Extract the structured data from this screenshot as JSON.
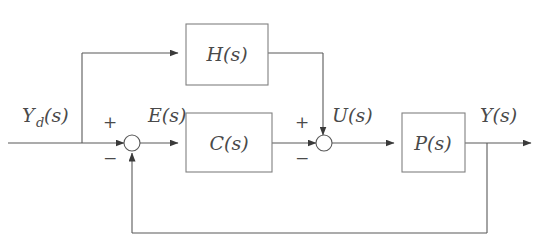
{
  "diagram": {
    "stroke_color": "#595959",
    "text_color": "#4a4a4a",
    "background": "#ffffff",
    "blocks": [
      {
        "id": "H",
        "label": "H(s)",
        "x": 186,
        "y": 24,
        "w": 82,
        "h": 61
      },
      {
        "id": "C",
        "label": "C(s)",
        "x": 186,
        "y": 113,
        "w": 86,
        "h": 59
      },
      {
        "id": "P",
        "label": "P(s)",
        "x": 402,
        "y": 113,
        "w": 63,
        "h": 59
      }
    ],
    "signals": {
      "reference_base": "Y",
      "reference_sub": "d",
      "reference_arg": "(s)",
      "error": "E(s)",
      "control": "U(s)",
      "output": "Y(s)"
    },
    "summing_junctions": [
      {
        "id": "sum-error",
        "cx": 132,
        "cy": 143,
        "r": 8,
        "plus": "+",
        "minus": "−",
        "plus_pos": {
          "x": 110,
          "y": 128
        },
        "minus_pos": {
          "x": 110,
          "y": 164
        }
      },
      {
        "id": "sum-control",
        "cx": 324,
        "cy": 143,
        "r": 8,
        "plus": "+",
        "minus": "−",
        "plus_pos": {
          "x": 302,
          "y": 128
        },
        "minus_pos": {
          "x": 302,
          "y": 164
        }
      }
    ],
    "label_positions": {
      "reference": {
        "x": 22,
        "y": 122
      },
      "error": {
        "x": 148,
        "y": 122
      },
      "control": {
        "x": 332,
        "y": 122
      },
      "output": {
        "x": 480,
        "y": 122
      }
    },
    "lines": {
      "main_y": 143,
      "feedforward_y": 53,
      "feedback_y": 233,
      "input_start_x": 8,
      "branch_x": 82,
      "h_output_x": 323,
      "output_tap_x": 487,
      "output_end_x": 531,
      "feedback_return_x": 132
    }
  }
}
